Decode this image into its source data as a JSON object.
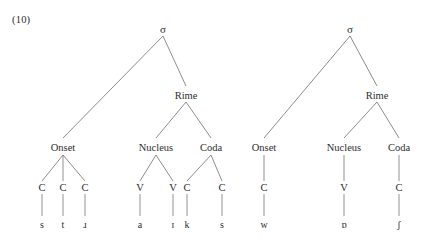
{
  "example_number": "(10)",
  "diagram": {
    "node_labels": {
      "syllable": "σ",
      "rime": "Rime",
      "onset": "Onset",
      "nucleus": "Nucleus",
      "coda": "Coda",
      "consonant": "C",
      "vowel": "V"
    },
    "colors": {
      "branch": "#6e6e6e",
      "text": "#2d2d2d",
      "background": "#ffffff"
    },
    "trees": [
      {
        "id": "tree-1",
        "root": "σ",
        "transcription": "strɑɪks",
        "constituents": [
          {
            "name": "Onset",
            "skeleton": [
              "C",
              "C",
              "C"
            ],
            "segments": [
              "s",
              "t",
              "ɹ"
            ]
          },
          {
            "name": "Nucleus",
            "skeleton": [
              "V",
              "V"
            ],
            "segments": [
              "a",
              "ɪ"
            ]
          },
          {
            "name": "Coda",
            "skeleton": [
              "C",
              "C"
            ],
            "segments": [
              "k",
              "s"
            ]
          }
        ]
      },
      {
        "id": "tree-2",
        "root": "σ",
        "transcription": "wɒʃ",
        "constituents": [
          {
            "name": "Onset",
            "skeleton": [
              "C"
            ],
            "segments": [
              "w"
            ]
          },
          {
            "name": "Nucleus",
            "skeleton": [
              "V"
            ],
            "segments": [
              "ɒ"
            ]
          },
          {
            "name": "Coda",
            "skeleton": [
              "C"
            ],
            "segments": [
              "ʃ"
            ]
          }
        ]
      }
    ]
  }
}
